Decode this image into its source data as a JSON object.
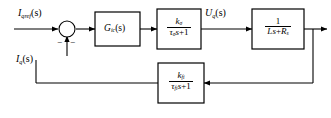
{
  "diagram": {
    "signals": {
      "reference_input": {
        "base": "I",
        "sub": "qref",
        "arg": "(s)",
        "full": "Iqref(s)"
      },
      "feedback_input": {
        "base": "I",
        "sub": "q",
        "arg": "(s)",
        "full": "Iq(s)"
      },
      "intermediate_output": {
        "base": "U",
        "sub": "q",
        "arg": "(s)",
        "full": "Uq(s)"
      }
    },
    "summing_junction": {
      "name": "summing-junction",
      "plus_sign": "",
      "minus_sign_left": "−",
      "minus_sign_bottom": "−"
    },
    "blocks": [
      {
        "id": "controller",
        "kind": "simple",
        "base": "G",
        "sub": "ic",
        "arg": "(s)",
        "full": "Gic(s)"
      },
      {
        "id": "converter",
        "kind": "fraction",
        "numerator": {
          "base": "k",
          "sub": "σ"
        },
        "denominator": {
          "tau": "τ",
          "tau_sub": "σ",
          "s": "s",
          "op": "+",
          "const": "1"
        },
        "full": "kσ / (τσ s + 1)"
      },
      {
        "id": "plant",
        "kind": "fraction",
        "numerator": {
          "const": "1"
        },
        "denominator": {
          "L": "L",
          "s": "s",
          "op": "+",
          "R": "R",
          "R_sub": "s"
        },
        "full": "1 / (Ls + Rs)"
      },
      {
        "id": "feedback-filter",
        "kind": "fraction",
        "numerator": {
          "base": "k",
          "sub": "fi"
        },
        "denominator": {
          "tau": "τ",
          "tau_sub": "fi",
          "s": "s",
          "op": "+",
          "const": "1"
        },
        "full": "kfi / (τfi s + 1)"
      }
    ],
    "colors": {
      "line": "#000000",
      "background": "#ffffff",
      "text": "#000000"
    }
  }
}
